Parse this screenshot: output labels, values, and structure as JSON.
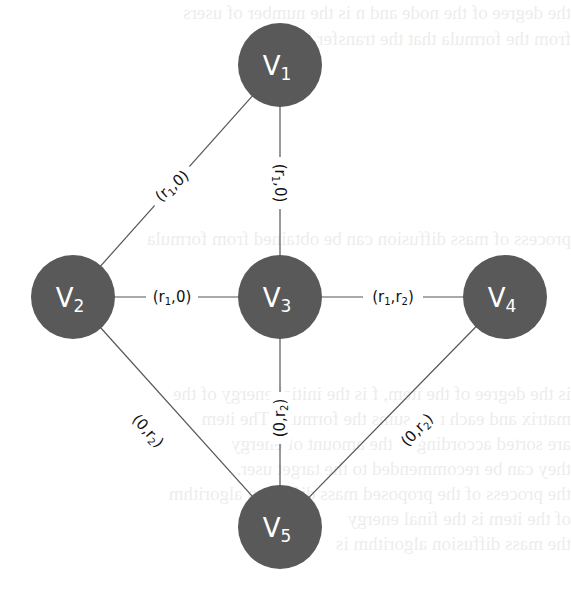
{
  "diagram": {
    "type": "graph",
    "node_color": "#595959",
    "node_text_color": "#ffffff",
    "edge_color": "#555555",
    "nodes": [
      {
        "id": "v1",
        "label": "V",
        "sub": "1",
        "x": 280,
        "y": 65
      },
      {
        "id": "v2",
        "label": "V",
        "sub": "2",
        "x": 73,
        "y": 297
      },
      {
        "id": "v3",
        "label": "V",
        "sub": "3",
        "x": 280,
        "y": 297
      },
      {
        "id": "v4",
        "label": "V",
        "sub": "4",
        "x": 505,
        "y": 297
      },
      {
        "id": "v5",
        "label": "V",
        "sub": "5",
        "x": 280,
        "y": 527
      }
    ],
    "edges": [
      {
        "from": "v1",
        "to": "v2",
        "label": "(r1,0)",
        "a": "r",
        "a_sub": "1",
        "b": "0",
        "b_sub": ""
      },
      {
        "from": "v1",
        "to": "v3",
        "label": "(r1,0)",
        "a": "r",
        "a_sub": "1",
        "b": "0",
        "b_sub": ""
      },
      {
        "from": "v2",
        "to": "v3",
        "label": "(r1,0)",
        "a": "r",
        "a_sub": "1",
        "b": "0",
        "b_sub": ""
      },
      {
        "from": "v3",
        "to": "v4",
        "label": "(r1,r2)",
        "a": "r",
        "a_sub": "1",
        "b": "r",
        "b_sub": "2"
      },
      {
        "from": "v2",
        "to": "v5",
        "label": "(0,r2)",
        "a": "0",
        "a_sub": "",
        "b": "r",
        "b_sub": "2"
      },
      {
        "from": "v3",
        "to": "v5",
        "label": "(0,r2)",
        "a": "0",
        "a_sub": "",
        "b": "r",
        "b_sub": "2"
      },
      {
        "from": "v4",
        "to": "v5",
        "label": "(0,r2)",
        "a": "0",
        "a_sub": "",
        "b": "r",
        "b_sub": "2"
      }
    ]
  },
  "text": {
    "paren_open": "(",
    "paren_close": ")",
    "comma": ","
  }
}
